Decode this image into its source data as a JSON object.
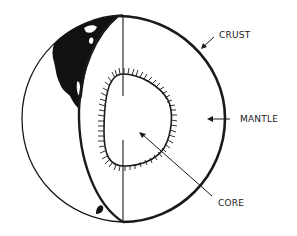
{
  "diagram": {
    "labels": {
      "crust": "CRUST",
      "mantle": "MANTLE",
      "core": "CORE"
    },
    "colors": {
      "line": "#1a1a1a",
      "background": "#ffffff",
      "continent": "#111111"
    }
  }
}
